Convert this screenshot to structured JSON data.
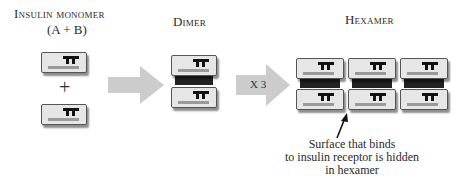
{
  "labels": {
    "monomer_title": "Insulin monomer",
    "monomer_subtitle": "(A + B)",
    "dimer_title": "Dimer",
    "hexamer_title": "Hexamer",
    "plus_sign": "+",
    "multiplier": "X 3"
  },
  "callout": {
    "lines": [
      "Surface that binds",
      "to insulin receptor is hidden",
      "in hexamer"
    ]
  },
  "stages": [
    {
      "name": "monomer",
      "units": 2,
      "arrangement": "separate (A + B)"
    },
    {
      "name": "dimer",
      "units": 2,
      "arrangement": "stacked, joined"
    },
    {
      "name": "hexamer",
      "units": 6,
      "arrangement": "3 dimers side by side"
    }
  ],
  "colors": {
    "block_fill": "#e6e6e6",
    "block_border": "#555555",
    "bar": "#9a9a9a",
    "glyph": "#111111",
    "arrow": "#c9c9c9",
    "band": "#222222"
  }
}
